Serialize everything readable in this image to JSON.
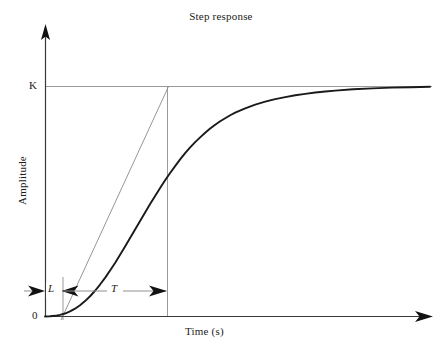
{
  "chart_data": {
    "type": "line",
    "title": "Step response",
    "xlabel": "Time (s)",
    "ylabel": "Amplitude",
    "grid": false,
    "legend": null,
    "axis_origin_label": "0",
    "steady_state_label": "K",
    "annotations": [
      {
        "name": "dead-time",
        "label": "L",
        "style": "italic",
        "from_x": 0.0,
        "to_x": 0.17
      },
      {
        "name": "time-constant",
        "label": "T",
        "style": "italic",
        "from_x": 0.17,
        "to_x": 0.485
      }
    ],
    "xlim": [
      0,
      1
    ],
    "ylim": [
      0,
      1.18
    ],
    "steady_state_value": 1.0,
    "curve_name": "process-step-response",
    "curve_color": "#1a1a1a",
    "tangent_color": "#8a8a8a",
    "reference_line_color": "#8a8a8a",
    "axis_color": "#3a3a3a",
    "series": [
      {
        "name": "step response",
        "x": [
          0.0,
          0.013,
          0.026,
          0.039,
          0.052,
          0.065,
          0.078,
          0.091,
          0.104,
          0.117,
          0.13,
          0.143,
          0.156,
          0.169,
          0.182,
          0.195,
          0.208,
          0.221,
          0.234,
          0.247,
          0.26,
          0.273,
          0.286,
          0.299,
          0.312,
          0.325,
          0.338,
          0.351,
          0.364,
          0.377,
          0.39,
          0.403,
          0.416,
          0.429,
          0.442,
          0.455,
          0.468,
          0.481,
          0.494,
          0.52,
          0.546,
          0.572,
          0.598,
          0.624,
          0.65,
          0.676,
          0.702,
          0.728,
          0.754,
          0.8,
          0.85,
          0.9,
          0.95,
          1.0
        ],
        "y": [
          0.0,
          0.001,
          0.003,
          0.007,
          0.013,
          0.022,
          0.034,
          0.049,
          0.067,
          0.088,
          0.112,
          0.139,
          0.168,
          0.2,
          0.233,
          0.268,
          0.304,
          0.341,
          0.378,
          0.415,
          0.452,
          0.489,
          0.524,
          0.559,
          0.592,
          0.624,
          0.654,
          0.683,
          0.71,
          0.735,
          0.758,
          0.779,
          0.799,
          0.817,
          0.834,
          0.849,
          0.862,
          0.875,
          0.886,
          0.905,
          0.921,
          0.934,
          0.945,
          0.954,
          0.962,
          0.968,
          0.974,
          0.978,
          0.982,
          0.988,
          0.992,
          0.995,
          0.997,
          0.999
        ]
      }
    ],
    "tangent": {
      "name": "inflection-tangent",
      "x_at_zero": 0.17,
      "x_at_K": 0.485
    }
  },
  "axes": {
    "y_arrow": "up-arrow-icon",
    "x_arrow": "right-arrow-icon"
  }
}
